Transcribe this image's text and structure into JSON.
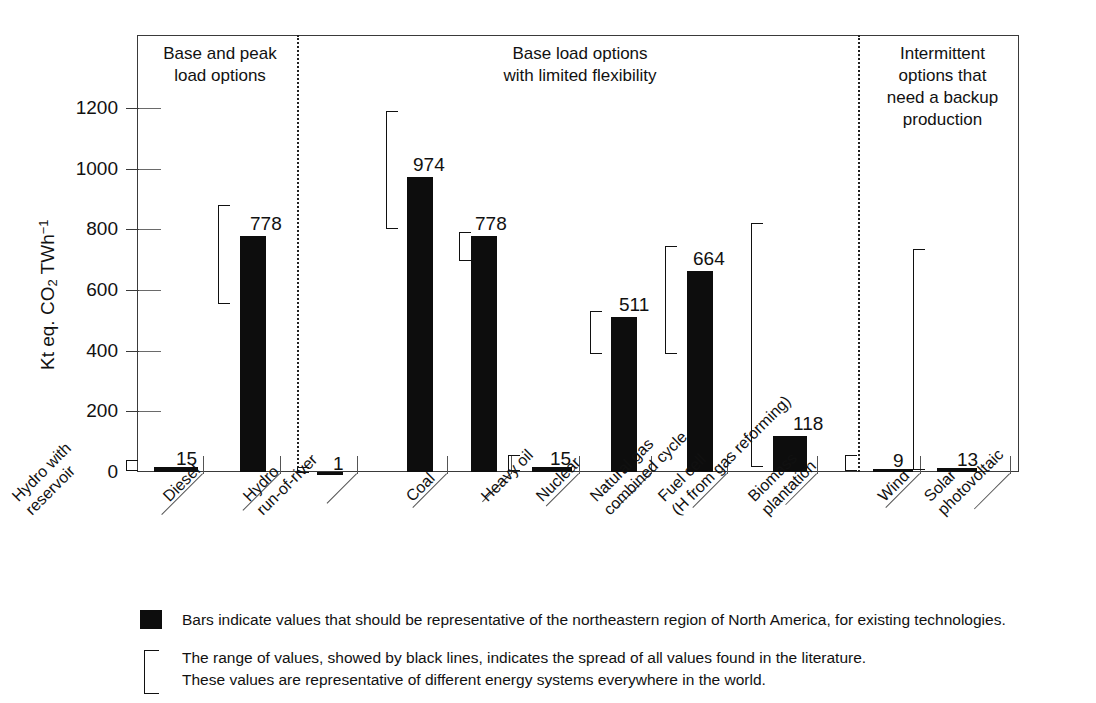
{
  "chart_data": {
    "type": "bar",
    "title": "",
    "xlabel": "",
    "ylabel": "Kt eq. CO2 TWh-1",
    "ylabel_parts": {
      "prefix": "Kt eq. CO",
      "sub": "2",
      "mid": " TWh",
      "sup": "−1"
    },
    "ylim": [
      0,
      1280
    ],
    "yticks": [
      0,
      200,
      400,
      600,
      800,
      1000,
      1200
    ],
    "ytick_labels": [
      "0",
      "200",
      "400",
      "600",
      "800",
      "1000",
      "1200"
    ],
    "grid": false,
    "legend_position": "below-plot",
    "categories": [
      "Hydro with reservoir",
      "Diesel",
      "Hydro run-of-river",
      "Coal",
      "Heavy oil",
      "Nuclear",
      "Natural gas combined cycle",
      "Fuel cell (H from gas reforming)",
      "Biomass plantation",
      "Wind",
      "Solar photovoltaic"
    ],
    "values": [
      15,
      778,
      1,
      974,
      778,
      15,
      511,
      664,
      118,
      9,
      13
    ],
    "value_labels": [
      "15",
      "778",
      "1",
      "974",
      "778",
      "15",
      "511",
      "664",
      "118",
      "9",
      "13"
    ],
    "ranges": [
      {
        "low": 2,
        "high": 40
      },
      {
        "low": 555,
        "high": 880
      },
      {
        "low": 0,
        "high": 16
      },
      {
        "low": 800,
        "high": 1190
      },
      {
        "low": 695,
        "high": 790
      },
      {
        "low": 3,
        "high": 55
      },
      {
        "low": 390,
        "high": 530
      },
      {
        "low": 390,
        "high": 745
      },
      {
        "low": 18,
        "high": 820
      },
      {
        "low": 2,
        "high": 55
      },
      {
        "low": 5,
        "high": 735
      }
    ],
    "sections": [
      {
        "title": "Base and peak\nload options",
        "line1": "Base and peak",
        "line2": "load options",
        "line3": "",
        "line4": ""
      },
      {
        "title": "Base load options\nwith limited flexibility",
        "line1": "Base load options",
        "line2": "with limited flexibility",
        "line3": "",
        "line4": ""
      },
      {
        "title": "Intermittent options that need a backup production",
        "line1": "Intermittent",
        "line2": "options that",
        "line3": "need a backup",
        "line4": "production"
      }
    ],
    "annotations": [
      "Bars indicate values that should be representative of the northeastern region of North America, for existing technologies.",
      "The range of values, showed by black lines, indicates the spread of all values found in the literature.",
      "These values are representative of different energy systems everywhere in the world."
    ]
  },
  "legend": {
    "bars_note": "Bars indicate values that should be representative of the northeastern region of North America, for existing technologies.",
    "range_note_line1": "The range of values, showed by black lines, indicates the spread of all values found in the literature.",
    "range_note_line2": "These values are representative of different energy systems everywhere in the world."
  },
  "colors": {
    "bar": "#0d0d0d",
    "axis": "#3a3a3a",
    "text": "#111111",
    "divider": "#222222",
    "background": "#ffffff"
  }
}
